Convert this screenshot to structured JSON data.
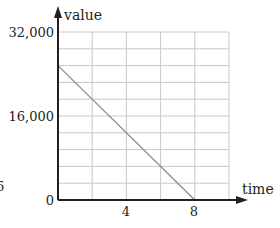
{
  "chart_data": {
    "type": "line",
    "title": "",
    "xlabel": "time",
    "ylabel": "value",
    "xlim": [
      0,
      10
    ],
    "ylim": [
      0,
      32000
    ],
    "x_ticks": [
      {
        "value": 4,
        "label": "4"
      },
      {
        "value": 8,
        "label": "8"
      }
    ],
    "y_ticks": [
      {
        "value": 0,
        "label": "0"
      },
      {
        "value": 16000,
        "label": "16,000"
      },
      {
        "value": 32000,
        "label": "32,000"
      }
    ],
    "grid": true,
    "grid_x_step": 2,
    "grid_y_step": 3200,
    "series": [
      {
        "name": "value",
        "x": [
          0,
          8
        ],
        "y": [
          25600,
          0
        ],
        "color": "#8c8c8c"
      }
    ],
    "annotations": [
      {
        "text": "6",
        "note": "partially visible stray character at left edge"
      }
    ]
  },
  "labels": {
    "y_axis_title": "value",
    "x_axis_title": "time",
    "y_top": "32,000",
    "y_mid": "16,000",
    "origin": "0",
    "x_4": "4",
    "x_8": "8",
    "stray": "6"
  },
  "colors": {
    "axis": "#231f20",
    "grid": "#c8c8c8",
    "line": "#8c8c8c"
  }
}
